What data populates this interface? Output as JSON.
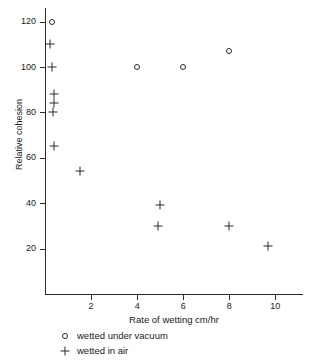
{
  "chart_data": {
    "type": "scatter",
    "title": "",
    "xlabel": "Rate of wetting  cm/hr",
    "ylabel": "Relative cohesion",
    "xlim": [
      0,
      11.2
    ],
    "ylim": [
      0,
      126
    ],
    "grid": false,
    "legend_position": "below-axes-left",
    "x_ticks": [
      2,
      4,
      6,
      8,
      10
    ],
    "y_ticks": [
      20,
      40,
      60,
      80,
      100,
      120
    ],
    "x_tick_labels": [
      "2",
      "4",
      "6",
      "8",
      "10"
    ],
    "y_tick_labels": [
      "20",
      "40",
      "60",
      "80",
      "100",
      "120"
    ],
    "series": [
      {
        "name": "wetted under vacuum",
        "marker": "open-circle",
        "points": [
          {
            "x": 0.3,
            "y": 120
          },
          {
            "x": 4.0,
            "y": 100
          },
          {
            "x": 6.0,
            "y": 100
          },
          {
            "x": 8.0,
            "y": 107
          }
        ]
      },
      {
        "name": "wetted in air",
        "marker": "plus",
        "points": [
          {
            "x": 0.2,
            "y": 110
          },
          {
            "x": 0.3,
            "y": 100
          },
          {
            "x": 0.4,
            "y": 88
          },
          {
            "x": 0.4,
            "y": 84
          },
          {
            "x": 0.35,
            "y": 80
          },
          {
            "x": 0.4,
            "y": 65
          },
          {
            "x": 1.5,
            "y": 54
          },
          {
            "x": 5.0,
            "y": 39
          },
          {
            "x": 4.9,
            "y": 30
          },
          {
            "x": 8.0,
            "y": 30
          },
          {
            "x": 9.7,
            "y": 21
          }
        ]
      }
    ]
  },
  "legend": {
    "items": [
      {
        "symbol": "open-circle",
        "label": "wetted under vacuum"
      },
      {
        "symbol": "plus",
        "label": "wetted in air"
      }
    ]
  },
  "colors": {
    "axis": "#2b2b2b",
    "marker": "#2b2b2b",
    "background": "#ffffff"
  }
}
